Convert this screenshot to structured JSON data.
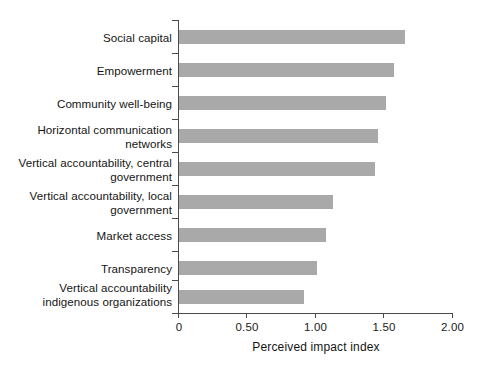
{
  "chart_data": {
    "type": "bar",
    "orientation": "horizontal",
    "title": "",
    "subtitle": "",
    "xlabel": "Perceived impact index",
    "ylabel": "",
    "xlim": [
      0,
      2.0
    ],
    "xticks": [
      0,
      0.5,
      1.0,
      1.5,
      2.0
    ],
    "xtick_labels": [
      "0",
      "0.50",
      "1.00",
      "1.50",
      "2.00"
    ],
    "grid": false,
    "legend": null,
    "bar_color": "#a9a9a9",
    "axis_color": "#4a4a4a",
    "text_color": "#151515",
    "categories": [
      "Social capital",
      "Empowerment",
      "Community well-being",
      "Horizontal communication\nnetworks",
      "Vertical accountability, central\ngovernment",
      "Vertical accountability, local\ngovernment",
      "Market access",
      "Transparency",
      "Vertical accountability\nindigenous organizations"
    ],
    "values": [
      1.66,
      1.58,
      1.52,
      1.46,
      1.44,
      1.13,
      1.08,
      1.01,
      0.92
    ]
  }
}
